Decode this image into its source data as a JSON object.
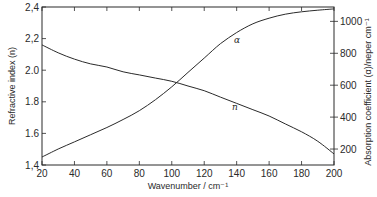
{
  "chart_data": {
    "type": "line",
    "title": "",
    "xlabel": "Wavenumber / cm⁻¹",
    "ylabel": "Refractive index (n)",
    "y2label": "Absorption coefficient (α)/neper cm⁻¹",
    "xlim": [
      20,
      200
    ],
    "ylim": [
      1.4,
      2.4
    ],
    "y2lim": [
      100,
      1090
    ],
    "x_ticks": [
      20,
      40,
      60,
      80,
      100,
      120,
      140,
      160,
      180,
      200
    ],
    "y_ticks": [
      "1.4",
      "1.6",
      "1.8",
      "2.0",
      "2.2",
      "2.4"
    ],
    "y2_ticks": [
      200,
      400,
      600,
      800,
      1000
    ],
    "grid": false,
    "legend": "inline curve labels",
    "series": [
      {
        "name": "n",
        "axis": "left",
        "label": "n",
        "x": [
          20,
          30,
          40,
          50,
          60,
          70,
          80,
          90,
          100,
          110,
          120,
          130,
          140,
          150,
          160,
          170,
          180,
          190,
          200
        ],
        "values": [
          2.16,
          2.11,
          2.07,
          2.04,
          2.02,
          1.99,
          1.97,
          1.95,
          1.93,
          1.9,
          1.87,
          1.83,
          1.79,
          1.75,
          1.71,
          1.66,
          1.61,
          1.55,
          1.47
        ]
      },
      {
        "name": "alpha",
        "axis": "right",
        "label": "α",
        "x": [
          20,
          30,
          40,
          50,
          60,
          70,
          80,
          90,
          100,
          110,
          120,
          130,
          140,
          150,
          160,
          170,
          180,
          190,
          200
        ],
        "values": [
          150,
          200,
          245,
          290,
          335,
          385,
          440,
          510,
          590,
          680,
          770,
          860,
          930,
          985,
          1020,
          1045,
          1060,
          1070,
          1078
        ]
      }
    ]
  },
  "labels": {
    "xlabel": "Wavenumber / cm⁻¹",
    "ylabel": "Refractive index (n)",
    "y2label": "Absorption coefficient (α)/neper cm⁻¹",
    "curve_n": "n",
    "curve_alpha": "α"
  },
  "colors": {
    "line": "#2a2a2a",
    "background": "#ffffff"
  }
}
